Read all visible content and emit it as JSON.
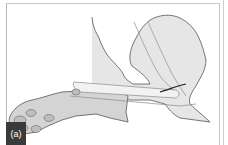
{
  "figure": {
    "panel_label": "(a)",
    "colors": {
      "fill": "#d4d4d4",
      "outline": "#555555",
      "inner_line": "#9a9a9a",
      "label_bg": "#3a3a3a",
      "label_text": "#ffffff"
    }
  }
}
